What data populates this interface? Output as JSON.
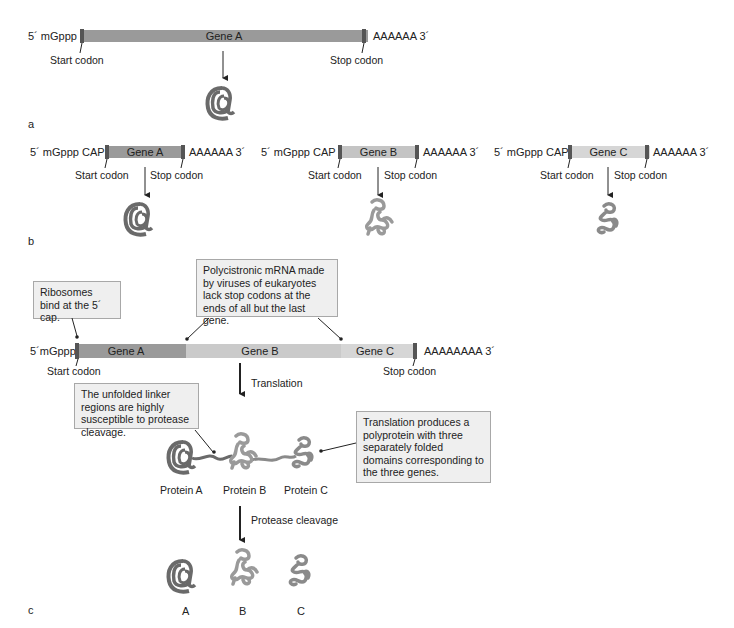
{
  "panel_a": {
    "label": "a",
    "five_prime": "5´ mGppp",
    "gene": "Gene A",
    "three_prime": "AAAAAA 3´",
    "start": "Start codon",
    "stop": "Stop codon"
  },
  "panel_b": {
    "label": "b",
    "genes": [
      {
        "five_prime": "5´ mGppp CAP",
        "gene": "Gene A",
        "three_prime": "AAAAAA 3´",
        "start": "Start codon",
        "stop": "Stop codon"
      },
      {
        "five_prime": "5´ mGppp CAP",
        "gene": "Gene B",
        "three_prime": "AAAAAA 3´",
        "start": "Start codon",
        "stop": "Stop codon"
      },
      {
        "five_prime": "5´ mGppp CAP",
        "gene": "Gene C",
        "three_prime": "AAAAAA 3´",
        "start": "Start codon",
        "stop": "Stop codon"
      }
    ]
  },
  "panel_c": {
    "label": "c",
    "five_prime": "5´mGppp",
    "genes": [
      "Gene A",
      "Gene B",
      "Gene C"
    ],
    "three_prime": "AAAAAAAA  3´",
    "start": "Start codon",
    "stop": "Stop codon",
    "callout_ribosome": "Ribosomes bind at the 5´ cap.",
    "callout_polycistronic": "Polycistronic mRNA made by viruses of eukaryotes lack stop codons at the ends of all but the last gene.",
    "callout_linker": "The unfolded linker regions are highly susceptible to protease cleavage.",
    "callout_polyprotein": "Translation produces a polyprotein with three separately folded domains corresponding to the three genes.",
    "translation": "Translation",
    "protease": "Protease cleavage",
    "proteins": [
      "Protein A",
      "Protein B",
      "Protein C"
    ],
    "products": [
      "A",
      "B",
      "C"
    ]
  },
  "colors": {
    "gene_a": "#9a9a9a",
    "gene_b": "#c4c4c4",
    "gene_c": "#d6d6d6",
    "codon_mark": "#555555",
    "protein_a": "#6a6a6a",
    "protein_b": "#9a9a9a",
    "protein_c": "#8a8a8a",
    "callout_bg": "#efefef"
  }
}
